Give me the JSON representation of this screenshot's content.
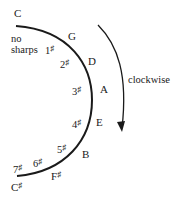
{
  "diagram": {
    "title": "",
    "direction_label": "clockwise",
    "start_key": "C",
    "start_note": "no sharps",
    "start_note_line1": "no",
    "start_note_line2": "sharps",
    "sharp_symbol": "♯",
    "keys": [
      {
        "key": "C",
        "sharps": "0"
      },
      {
        "key": "G",
        "sharps": "1"
      },
      {
        "key": "D",
        "sharps": "2"
      },
      {
        "key": "A",
        "sharps": "3"
      },
      {
        "key": "E",
        "sharps": "4"
      },
      {
        "key": "B",
        "sharps": "5"
      },
      {
        "key": "F",
        "key_suffix": "♯",
        "sharps": "6"
      },
      {
        "key": "C",
        "key_suffix": "♯",
        "sharps": "7"
      }
    ],
    "colors": {
      "ink": "#1a1a1a",
      "background": "#ffffff"
    }
  }
}
